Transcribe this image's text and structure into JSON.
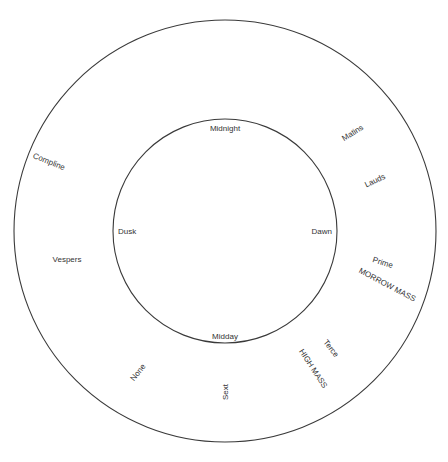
{
  "header": {
    "title": "THE UNREFORMED TIME OF THE DIVINE OFFICE",
    "page": "17"
  },
  "diagram": {
    "center": [
      225,
      231
    ],
    "outer_radius": 211,
    "inner_radius": 112,
    "stroke_color": "#3a3a3a",
    "inner_labels": {
      "top": "Midnight",
      "right": "Dawn",
      "bottom": "Midday",
      "left": "Dusk"
    },
    "hours": [
      {
        "name": "Matins",
        "x": 354,
        "y": 135,
        "rotate": -32
      },
      {
        "name": "Lauds",
        "x": 376,
        "y": 183,
        "rotate": -25
      },
      {
        "name": "Prime",
        "x": 382,
        "y": 265,
        "rotate": 18
      },
      {
        "name": "Terce",
        "x": 329,
        "y": 350,
        "rotate": 52
      },
      {
        "name": "Sext",
        "x": 228,
        "y": 399,
        "rotate": -90
      },
      {
        "name": "None",
        "x": 140,
        "y": 374,
        "rotate": -52
      },
      {
        "name": "Vespers",
        "x": 67,
        "y": 262,
        "rotate": 0
      },
      {
        "name": "Compline",
        "x": 48,
        "y": 164,
        "rotate": 22
      }
    ],
    "masses": [
      {
        "name": "MORROW MASS",
        "x": 386,
        "y": 287,
        "rotate": 28
      },
      {
        "name": "HIGH MASS",
        "x": 311,
        "y": 370,
        "rotate": 57
      }
    ]
  }
}
